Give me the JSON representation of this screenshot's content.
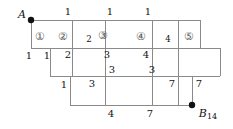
{
  "figure": {
    "type": "lattice-path-staircase-diagram",
    "background_color": "#ffffff",
    "line_color": "#8a8a8a",
    "text_color": "#111111",
    "circled_text_color": "#555555"
  },
  "points": [
    {
      "name": "A",
      "label": "A",
      "subscript": "",
      "x": 31,
      "y": 20
    },
    {
      "name": "B",
      "label": "B",
      "subscript": "14",
      "x": 192,
      "y": 105
    }
  ],
  "rows": [
    {
      "name": "row-1",
      "x1": 31,
      "x2": 200,
      "y1": 20,
      "y2": 48,
      "dividers": [
        72,
        105,
        152,
        178
      ]
    },
    {
      "name": "row-2",
      "x1": 50,
      "x2": 220,
      "y1": 48,
      "y2": 76,
      "dividers": [
        72,
        105,
        152,
        178
      ]
    },
    {
      "name": "row-3",
      "x1": 70,
      "x2": 192,
      "y1": 76,
      "y2": 105,
      "dividers": [
        105,
        152,
        178
      ]
    }
  ],
  "cell_labels": [
    {
      "name": "cell-1",
      "text": "①",
      "x": 40,
      "y": 36,
      "style": "circled"
    },
    {
      "name": "cell-2",
      "text": "②",
      "x": 63,
      "y": 36,
      "style": "circled"
    },
    {
      "name": "cell-3",
      "text": "③",
      "x": 103,
      "y": 35,
      "style": "circled"
    },
    {
      "name": "cell-4",
      "text": "④",
      "x": 141,
      "y": 36,
      "style": "circled"
    },
    {
      "name": "cell-5",
      "text": "⑤",
      "x": 189,
      "y": 36,
      "style": "circled"
    }
  ],
  "edge_labels": [
    {
      "name": "top-label-1",
      "text": "1",
      "x": 68,
      "y": 12,
      "style": "num"
    },
    {
      "name": "top-label-2",
      "text": "1",
      "x": 110,
      "y": 12,
      "style": "num"
    },
    {
      "name": "top-label-3",
      "text": "1",
      "x": 148,
      "y": 12,
      "style": "num"
    },
    {
      "name": "inner-label-2-top",
      "text": "2",
      "x": 89,
      "y": 39,
      "style": "num-small"
    },
    {
      "name": "inner-label-4-top",
      "text": "4",
      "x": 168,
      "y": 39,
      "style": "num-small"
    },
    {
      "name": "left-label-1a",
      "text": "1",
      "x": 29,
      "y": 56,
      "style": "num"
    },
    {
      "name": "left-label-1b",
      "text": "1",
      "x": 47,
      "y": 56,
      "style": "num"
    },
    {
      "name": "row2-label-2",
      "text": "2",
      "x": 68,
      "y": 55,
      "style": "num"
    },
    {
      "name": "row2-label-3",
      "text": "3",
      "x": 107,
      "y": 55,
      "style": "num"
    },
    {
      "name": "row2-label-4",
      "text": "4",
      "x": 146,
      "y": 55,
      "style": "num"
    },
    {
      "name": "row2-lower-label-3a",
      "text": "3",
      "x": 112,
      "y": 70,
      "style": "num"
    },
    {
      "name": "row2-lower-label-3b",
      "text": "3",
      "x": 152,
      "y": 70,
      "style": "num"
    },
    {
      "name": "row3-label-1",
      "text": "1",
      "x": 64,
      "y": 85,
      "style": "num"
    },
    {
      "name": "row3-label-3",
      "text": "3",
      "x": 92,
      "y": 84,
      "style": "num"
    },
    {
      "name": "row3-label-7a",
      "text": "7",
      "x": 172,
      "y": 84,
      "style": "num"
    },
    {
      "name": "row3-label-7b",
      "text": "7",
      "x": 199,
      "y": 84,
      "style": "num"
    },
    {
      "name": "bottom-label-4",
      "text": "4",
      "x": 111,
      "y": 114,
      "style": "num"
    },
    {
      "name": "bottom-label-7",
      "text": "7",
      "x": 150,
      "y": 114,
      "style": "num"
    }
  ]
}
